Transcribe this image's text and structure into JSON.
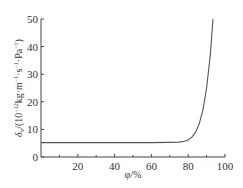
{
  "chart_data": {
    "type": "line",
    "title": "",
    "xlabel": "φ/%",
    "ylabel": "δv/(10⁻¹² kg·m⁻¹·s⁻¹·Pa⁻¹)",
    "xlim": [
      0,
      100
    ],
    "ylim": [
      0,
      50
    ],
    "x_ticks": [
      20,
      40,
      60,
      80,
      100
    ],
    "x_minor_ticks": [
      10,
      30,
      50,
      70,
      90
    ],
    "y_ticks": [
      0,
      10,
      20,
      30,
      40,
      50
    ],
    "grid": false,
    "legend": null,
    "series": [
      {
        "name": "δv",
        "color": "#555555",
        "x": [
          0,
          10,
          20,
          30,
          40,
          50,
          60,
          70,
          75,
          78,
          80,
          82,
          84,
          86,
          88,
          90,
          92,
          93.5
        ],
        "y": [
          5.2,
          5.2,
          5.2,
          5.2,
          5.2,
          5.2,
          5.2,
          5.3,
          5.4,
          5.7,
          6.2,
          7.2,
          9.0,
          12.0,
          17.0,
          25.0,
          37.0,
          50.0
        ]
      }
    ]
  },
  "axes": {
    "x_title_main": "φ/%",
    "y_title": {
      "delta": "δ",
      "sub": "v",
      "mid": "/(10",
      "exp1": "−12",
      "units": "kg·m",
      "exp2": "−1",
      "s": "·s",
      "exp3": "−1",
      "pa": "·Pa",
      "exp4": "−1",
      "close": ")"
    },
    "x_tick_labels": [
      "20",
      "40",
      "60",
      "80",
      "100"
    ],
    "y_tick_labels": [
      "0",
      "10",
      "20",
      "30",
      "40",
      "50"
    ]
  }
}
